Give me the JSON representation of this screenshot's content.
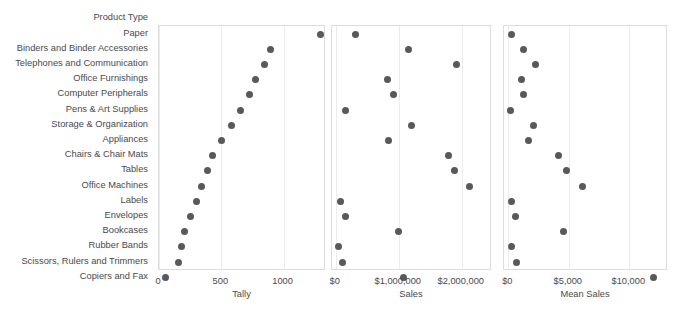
{
  "row_header": "Product Type",
  "categories": [
    "Paper",
    "Binders and Binder Accessories",
    "Telephones and Communication",
    "Office Furnishings",
    "Computer Peripherals",
    "Pens & Art Supplies",
    "Storage & Organization",
    "Appliances",
    "Chairs & Chair Mats",
    "Tables",
    "Office Machines",
    "Labels",
    "Envelopes",
    "Bookcases",
    "Rubber Bands",
    "Scissors, Rulers and Trimmers",
    "Copiers and Fax"
  ],
  "marker_color": "#595959",
  "panel_border_color": "#dcdcdc",
  "gridline_color": "#ececec",
  "chart_data": [
    {
      "type": "scatter",
      "title": "",
      "xlabel": "Tally",
      "ylabel": "Product Type",
      "xlim": [
        0,
        1340
      ],
      "grid": true,
      "legend": "none",
      "xticks": [
        0,
        500,
        1000
      ],
      "xticklabels": [
        "0",
        "500",
        "1000"
      ],
      "categories": [
        "Paper",
        "Binders and Binder Accessories",
        "Telephones and Communication",
        "Office Furnishings",
        "Computer Peripherals",
        "Pens & Art Supplies",
        "Storage & Organization",
        "Appliances",
        "Chairs & Chair Mats",
        "Tables",
        "Office Machines",
        "Labels",
        "Envelopes",
        "Bookcases",
        "Rubber Bands",
        "Scissors, Rulers and Trimmers",
        "Copiers and Fax"
      ],
      "values": [
        1292,
        898,
        843,
        775,
        730,
        650,
        580,
        500,
        430,
        390,
        345,
        300,
        255,
        205,
        180,
        155,
        55
      ]
    },
    {
      "type": "scatter",
      "title": "",
      "xlabel": "Sales",
      "ylabel": "Product Type",
      "xlim": [
        -60000,
        2480000
      ],
      "grid": true,
      "legend": "none",
      "xticks": [
        0,
        1000000,
        2000000
      ],
      "xticklabels": [
        "$0",
        "$1,000,000",
        "$2,000,000"
      ],
      "categories": [
        "Paper",
        "Binders and Binder Accessories",
        "Telephones and Communication",
        "Office Furnishings",
        "Computer Peripherals",
        "Pens & Art Supplies",
        "Storage & Organization",
        "Appliances",
        "Chairs & Chair Mats",
        "Tables",
        "Office Machines",
        "Labels",
        "Envelopes",
        "Bookcases",
        "Rubber Bands",
        "Scissors, Rulers and Trimmers",
        "Copiers and Fax"
      ],
      "values": [
        320000,
        1160000,
        1920000,
        820000,
        920000,
        160000,
        1200000,
        840000,
        1790000,
        1880000,
        2120000,
        80000,
        160000,
        1000000,
        40000,
        100000,
        1080000
      ]
    },
    {
      "type": "scatter",
      "title": "",
      "xlabel": "Mean Sales",
      "ylabel": "Product Type",
      "xlim": [
        -360,
        13200
      ],
      "grid": true,
      "legend": "none",
      "xticks": [
        0,
        5000,
        10000
      ],
      "xticklabels": [
        "$0",
        "$5,000",
        "$10,000"
      ],
      "categories": [
        "Paper",
        "Binders and Binder Accessories",
        "Telephones and Communication",
        "Office Furnishings",
        "Computer Peripherals",
        "Pens & Art Supplies",
        "Storage & Organization",
        "Appliances",
        "Chairs & Chair Mats",
        "Tables",
        "Office Machines",
        "Labels",
        "Envelopes",
        "Bookcases",
        "Rubber Bands",
        "Scissors, Rulers and Trimmers",
        "Copiers and Fax"
      ],
      "values": [
        250,
        1280,
        2280,
        1060,
        1250,
        180,
        2050,
        1660,
        4180,
        4830,
        6160,
        270,
        630,
        4600,
        220,
        650,
        11980
      ]
    }
  ]
}
